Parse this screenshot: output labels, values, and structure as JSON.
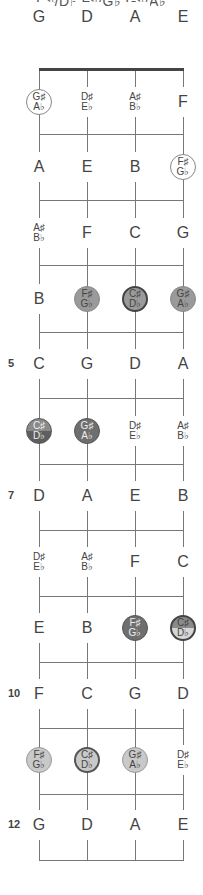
{
  "title": "C♯/D♭  F♯/G♭  G♯/A♭",
  "diagram": {
    "type": "fretboard",
    "strings": [
      "G",
      "D",
      "A",
      "E"
    ],
    "string_x": [
      39,
      87,
      135,
      183
    ],
    "nut_y": 69,
    "fret_lines_y": [
      134,
      200,
      265,
      332,
      398,
      464,
      530,
      596,
      662,
      728,
      794,
      860
    ],
    "row_y": [
      17,
      102,
      167,
      233,
      299,
      364,
      431,
      496,
      562,
      628,
      694,
      760,
      825
    ],
    "fret_labels": [
      {
        "fret": 5,
        "label": "5"
      },
      {
        "fret": 7,
        "label": "7"
      },
      {
        "fret": 10,
        "label": "10"
      },
      {
        "fret": 12,
        "label": "12"
      }
    ],
    "highlight_colors": {
      "outline": "#ffffff",
      "light": "#c9c9c9",
      "mid": "#9a9a9a",
      "dark": "#6e6e6e"
    },
    "rows": [
      {
        "fret": 0,
        "notes": [
          {
            "top": "G"
          },
          {
            "top": "D"
          },
          {
            "top": "A"
          },
          {
            "top": "E"
          }
        ]
      },
      {
        "fret": 1,
        "notes": [
          {
            "top": "G♯",
            "bottom": "A♭",
            "style": "outline"
          },
          {
            "top": "D♯",
            "bottom": "E♭"
          },
          {
            "top": "A♯",
            "bottom": "B♭"
          },
          {
            "top": "F"
          }
        ]
      },
      {
        "fret": 2,
        "notes": [
          {
            "top": "A"
          },
          {
            "top": "E"
          },
          {
            "top": "B"
          },
          {
            "top": "F♯",
            "bottom": "G♭",
            "style": "outline"
          }
        ]
      },
      {
        "fret": 3,
        "notes": [
          {
            "top": "A♯",
            "bottom": "B♭"
          },
          {
            "top": "F"
          },
          {
            "top": "C"
          },
          {
            "top": "G"
          }
        ]
      },
      {
        "fret": 4,
        "notes": [
          {
            "top": "B"
          },
          {
            "top": "F♯",
            "bottom": "G♭",
            "style": "mid"
          },
          {
            "top": "C♯",
            "bottom": "D♭",
            "style": "mid-bold"
          },
          {
            "top": "G♯",
            "bottom": "A♭",
            "style": "mid"
          }
        ]
      },
      {
        "fret": 5,
        "notes": [
          {
            "top": "C"
          },
          {
            "top": "G"
          },
          {
            "top": "D"
          },
          {
            "top": "A"
          }
        ]
      },
      {
        "fret": 6,
        "notes": [
          {
            "top": "C♯",
            "bottom": "D♭",
            "style": "split-dark"
          },
          {
            "top": "G♯",
            "bottom": "A♭",
            "style": "dark"
          },
          {
            "top": "D♯",
            "bottom": "E♭"
          },
          {
            "top": "A♯",
            "bottom": "B♭"
          }
        ]
      },
      {
        "fret": 7,
        "notes": [
          {
            "top": "D"
          },
          {
            "top": "A"
          },
          {
            "top": "E"
          },
          {
            "top": "B"
          }
        ]
      },
      {
        "fret": 8,
        "notes": [
          {
            "top": "D♯",
            "bottom": "E♭"
          },
          {
            "top": "A♯",
            "bottom": "B♭"
          },
          {
            "top": "F"
          },
          {
            "top": "C"
          }
        ]
      },
      {
        "fret": 9,
        "notes": [
          {
            "top": "E"
          },
          {
            "top": "B"
          },
          {
            "top": "F♯",
            "bottom": "G♭",
            "style": "dark"
          },
          {
            "top": "C♯",
            "bottom": "D♭",
            "style": "split-light"
          }
        ]
      },
      {
        "fret": 10,
        "notes": [
          {
            "top": "F"
          },
          {
            "top": "C"
          },
          {
            "top": "G"
          },
          {
            "top": "D"
          }
        ]
      },
      {
        "fret": 11,
        "notes": [
          {
            "top": "F♯",
            "bottom": "G♭",
            "style": "light"
          },
          {
            "top": "C♯",
            "bottom": "D♭",
            "style": "light-bold"
          },
          {
            "top": "G♯",
            "bottom": "A♭",
            "style": "light"
          },
          {
            "top": "D♯",
            "bottom": "E♭"
          }
        ]
      },
      {
        "fret": 12,
        "notes": [
          {
            "top": "G"
          },
          {
            "top": "D"
          },
          {
            "top": "A"
          },
          {
            "top": "E"
          }
        ]
      }
    ]
  }
}
